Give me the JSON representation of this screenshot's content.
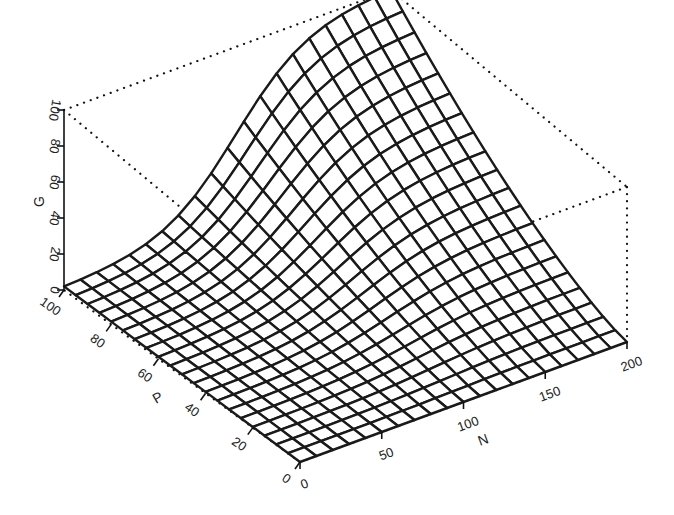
{
  "chart_data": {
    "type": "surface",
    "title": "",
    "xlabel": "N",
    "ylabel": "P",
    "zlabel": "G",
    "x_ticks": [
      0,
      50,
      100,
      150,
      200
    ],
    "y_ticks": [
      0,
      20,
      40,
      60,
      80,
      100
    ],
    "z_ticks": [
      0,
      20,
      40,
      60,
      80,
      100
    ],
    "xlim": [
      0,
      200
    ],
    "ylim": [
      0,
      100
    ],
    "zlim": [
      0,
      100
    ],
    "grid": "wireframe mesh 20x20",
    "box": "dotted bounding box",
    "sample_points": [
      {
        "N": 0,
        "P": 100,
        "G": 3
      },
      {
        "N": 50,
        "P": 100,
        "G": 15
      },
      {
        "N": 100,
        "P": 100,
        "G": 55
      },
      {
        "N": 150,
        "P": 100,
        "G": 90
      },
      {
        "N": 200,
        "P": 100,
        "G": 100
      },
      {
        "N": 200,
        "P": 50,
        "G": 45
      },
      {
        "N": 200,
        "P": 0,
        "G": 0
      },
      {
        "N": 100,
        "P": 50,
        "G": 20
      },
      {
        "N": 0,
        "P": 0,
        "G": 0
      }
    ]
  },
  "axes": {
    "g_label": "G",
    "p_label": "P",
    "n_label": "N",
    "g_ticks": [
      "0",
      "20",
      "40",
      "60",
      "80",
      "100"
    ],
    "p_ticks": [
      "0",
      "20",
      "40",
      "60",
      "80",
      "100"
    ],
    "n_ticks": [
      "0",
      "50",
      "100",
      "150",
      "200"
    ]
  }
}
